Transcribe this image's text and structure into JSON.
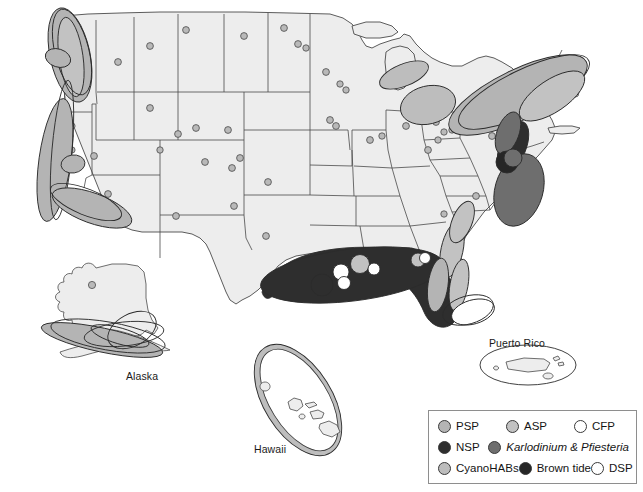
{
  "figure": {
    "type": "map",
    "region": "United States with Alaska, Hawaii and Puerto Rico insets"
  },
  "insets": [
    {
      "name": "alaska-inset",
      "label": "Alaska"
    },
    {
      "name": "hawaii-inset",
      "label": "Hawaii"
    },
    {
      "name": "puerto-rico-inset",
      "label": "Puerto Rico"
    }
  ],
  "legend": {
    "name": "hab-legend",
    "rows": [
      [
        {
          "key": "psp",
          "label": "PSP",
          "swatch": "sw-psp",
          "color": "#b4b4b4",
          "italic": false
        },
        {
          "key": "asp",
          "label": "ASP",
          "swatch": "sw-asp",
          "color": "#c2c2c2",
          "italic": false
        },
        {
          "key": "cfp",
          "label": "CFP",
          "swatch": "sw-cfp",
          "color": "#ffffff",
          "italic": false
        }
      ],
      [
        {
          "key": "nsp",
          "label": "NSP",
          "swatch": "sw-nsp",
          "color": "#2e2e2e",
          "italic": false
        },
        {
          "key": "kp",
          "label": "Karlodinium & Pfiesteria",
          "swatch": "sw-kp",
          "color": "#6e6e6e",
          "italic": true
        }
      ],
      [
        {
          "key": "cyano",
          "label": "CyanoHABs",
          "swatch": "sw-cyano",
          "color": "#bdbdbd",
          "italic": false
        },
        {
          "key": "brown",
          "label": "Brown tide",
          "swatch": "sw-brown",
          "color": "#262626",
          "italic": false
        },
        {
          "key": "dsp",
          "label": "DSP",
          "swatch": "sw-dsp",
          "color": "#ffffff",
          "italic": false
        }
      ]
    ]
  },
  "colors": {
    "land": "#ededed",
    "border": "#4a4a4a",
    "background": "#ffffff",
    "legend_border": "#8e8e8e"
  },
  "map_markers": {
    "note": "Ellipse overlays mark coastal/lake HAB occurrence; small circles mark inland CyanoHAB sites.",
    "cyanohab_inland_dot_count": 46
  }
}
